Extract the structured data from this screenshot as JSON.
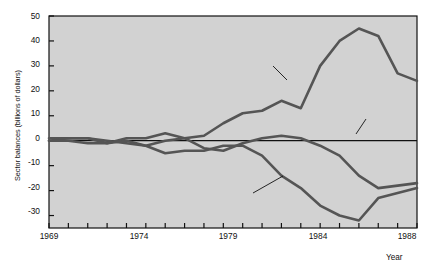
{
  "chart_data": {
    "type": "line",
    "title": "",
    "xlabel": "Year",
    "ylabel": "Sector balances (billions of dollars)",
    "xlim": [
      1969,
      1988
    ],
    "ylim": [
      -35,
      50
    ],
    "yticks": [
      50,
      40,
      30,
      20,
      10,
      0,
      -10,
      -20,
      -30
    ],
    "ytick_labels": [
      "50",
      "40",
      "30",
      "20",
      "10",
      "0",
      "-10",
      "-20",
      "-30"
    ],
    "xticks": [
      1969,
      1970,
      1971,
      1972,
      1973,
      1974,
      1975,
      1976,
      1977,
      1978,
      1979,
      1980,
      1981,
      1982,
      1983,
      1984,
      1985,
      1986,
      1987,
      1988
    ],
    "xtick_labels_shown": [
      "1969",
      "1974",
      "1979",
      "1984",
      "1988"
    ],
    "grid": false,
    "legend": "inline-annotations",
    "zero_line": true,
    "x": [
      1969,
      1970,
      1971,
      1972,
      1973,
      1974,
      1975,
      1976,
      1977,
      1978,
      1979,
      1980,
      1981,
      1982,
      1983,
      1984,
      1985,
      1986,
      1987,
      1988
    ],
    "series": [
      {
        "name": "Private surplus",
        "color": "#555555",
        "values": [
          1,
          1,
          1,
          0,
          -1,
          -2,
          0,
          1,
          2,
          7,
          11,
          12,
          16,
          13,
          30,
          40,
          45,
          42,
          27,
          24
        ]
      },
      {
        "name": "Current account",
        "color": "#555555",
        "values": [
          0,
          1,
          1,
          -1,
          1,
          1,
          3,
          1,
          -3,
          -4,
          -1,
          1,
          2,
          1,
          -2,
          -6,
          -14,
          -19,
          -18,
          -17
        ]
      },
      {
        "name": "Government deficit",
        "color": "#555555",
        "values": [
          0,
          0,
          -1,
          -1,
          0,
          -2,
          -5,
          -4,
          -4,
          -2,
          -2,
          -6,
          -14,
          -19,
          -26,
          -30,
          -32,
          -23,
          -21,
          -19
        ]
      }
    ],
    "annotations": [
      {
        "text": "Private surplus",
        "x": 1978,
        "y": 31
      },
      {
        "text": "Current account",
        "x": 1984,
        "y": 14
      },
      {
        "text": "Government deficit",
        "x": 1979,
        "y": -23
      }
    ]
  },
  "style": {
    "plot_background": "#d2d2d2",
    "line_color": "#555555",
    "axis_color": "#111111",
    "page_background": "#ffffff"
  }
}
